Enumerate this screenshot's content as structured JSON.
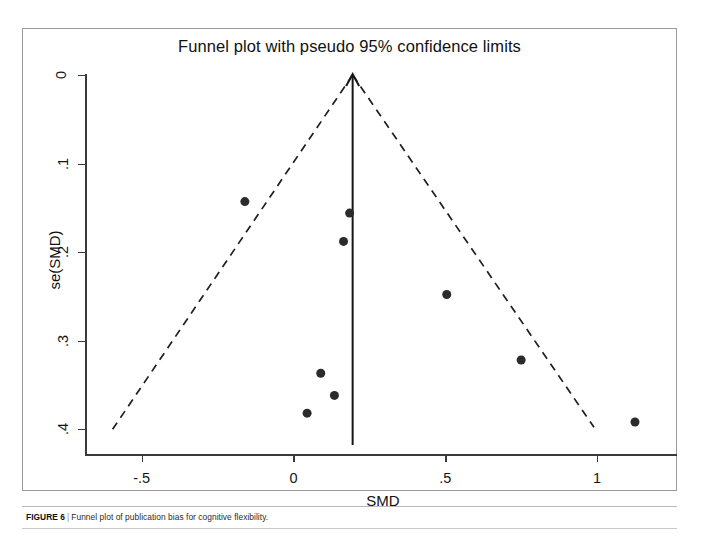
{
  "chart_data": {
    "type": "scatter",
    "title": "Funnel plot with pseudo 95% confidence limits",
    "xlabel": "SMD",
    "ylabel": "se(SMD)",
    "xlim": [
      -0.68,
      1.27
    ],
    "ylim": [
      0.0,
      0.418
    ],
    "y_inverted": true,
    "grid": false,
    "legend": "none",
    "x_ticks": [
      {
        "value": -0.5,
        "label": "-.5"
      },
      {
        "value": 0,
        "label": "0"
      },
      {
        "value": 0.5,
        "label": ".5"
      },
      {
        "value": 1,
        "label": "1"
      }
    ],
    "y_ticks": [
      {
        "value": 0,
        "label": "0"
      },
      {
        "value": 0.1,
        "label": ".1"
      },
      {
        "value": 0.2,
        "label": ".2"
      },
      {
        "value": 0.3,
        "label": ".3"
      },
      {
        "value": 0.4,
        "label": ".4"
      }
    ],
    "points": [
      {
        "x": -0.16,
        "y": 0.143
      },
      {
        "x": 0.185,
        "y": 0.156
      },
      {
        "x": 0.165,
        "y": 0.188
      },
      {
        "x": 0.505,
        "y": 0.248
      },
      {
        "x": 0.09,
        "y": 0.337
      },
      {
        "x": 0.75,
        "y": 0.322
      },
      {
        "x": 0.135,
        "y": 0.362
      },
      {
        "x": 0.045,
        "y": 0.382
      },
      {
        "x": 1.125,
        "y": 0.392
      },
      {
        "x": 0.195,
        "y": 0.0
      }
    ],
    "pooled_effect": 0.195,
    "reference_line": {
      "type": "vertical",
      "x": 0.195,
      "style": "solid",
      "has_arrow_head": true,
      "y_from": 0.418,
      "y_to": 0.0
    },
    "confidence_limits": {
      "style": "dashed",
      "description": "pseudo 95% confidence limits",
      "apex": {
        "x": 0.195,
        "y": 0.0
      },
      "left_end": {
        "x": -0.605,
        "y": 0.405
      },
      "right_end": {
        "x": 0.99,
        "y": 0.398
      }
    },
    "marker": {
      "shape": "circle",
      "color": "#2b2b2b",
      "size_px": 9
    }
  },
  "caption": {
    "label": "FIGURE 6",
    "separator": "|",
    "text": "Funnel plot of publication bias for cognitive flexibility."
  }
}
